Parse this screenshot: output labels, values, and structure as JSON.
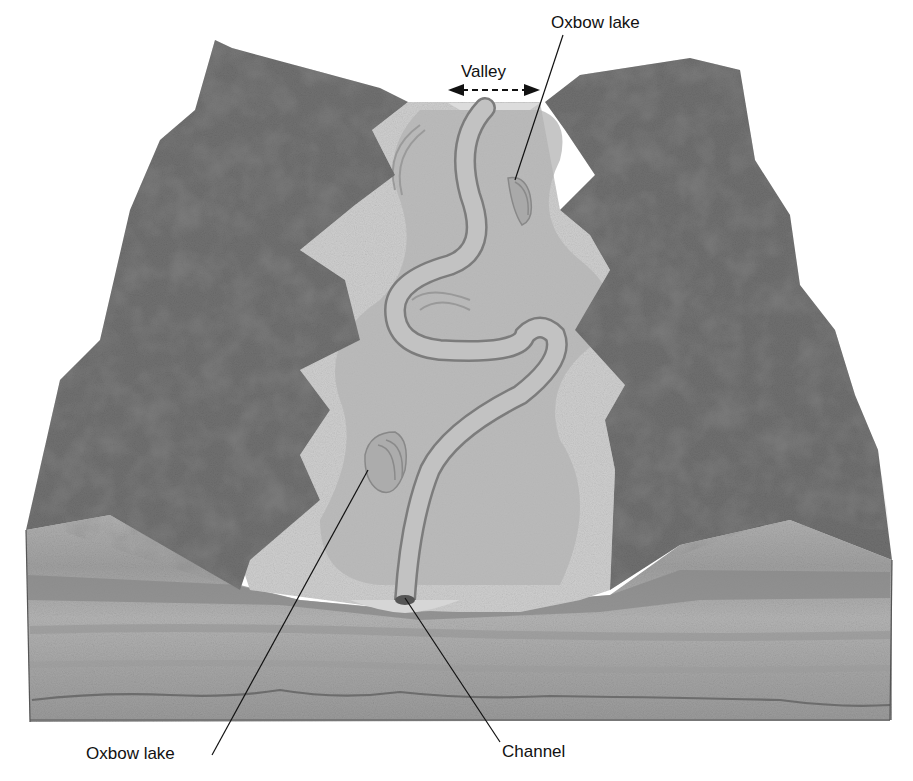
{
  "diagram": {
    "labels": {
      "valley": "Valley",
      "oxbow_lake_top": "Oxbow lake",
      "oxbow_lake_bottom": "Oxbow lake",
      "channel": "Channel"
    },
    "colors": {
      "background": "#ffffff",
      "forest": "#6a6a6a",
      "floodplain_light": "#c9c9c9",
      "floodplain_mid": "#b0b0b0",
      "channel": "#bdbdbd",
      "strata_light": "#a8a8a8",
      "strata_dark": "#838383",
      "leader_line": "#111111"
    }
  }
}
